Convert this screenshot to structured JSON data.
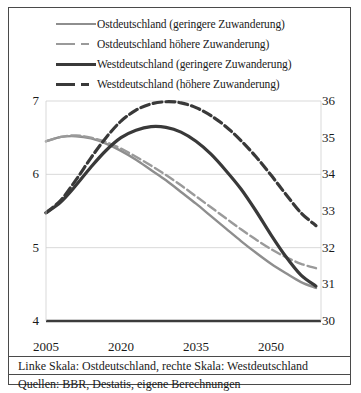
{
  "legend": {
    "entries": [
      {
        "label": "Ostdeutschland (geringere Zuwanderung)",
        "style": "gray-solid",
        "color": "#8e8e8e"
      },
      {
        "label": "Ostdeutschland höhere Zuwanderung)",
        "style": "gray-dashed",
        "color": "#9a9a9a"
      },
      {
        "label": "Westdeutschland (geringere Zuwanderung)",
        "style": "black-solid",
        "color": "#393939"
      },
      {
        "label": "Westdeutschland (höhere Zuwanderung)",
        "style": "black-dashed",
        "color": "#393939"
      }
    ]
  },
  "notes": {
    "scales": "Linke Skala: Ostdeutschland, rechte Skala: Westdeutschland",
    "sources": "Quellen: BBR, Destatis, eigene Berechnungen"
  },
  "chart_data": {
    "type": "line",
    "title": "",
    "xlabel": "",
    "ylabel": "",
    "y_left_label": "Ostdeutschland",
    "y_right_label": "Westdeutschland",
    "xlim": [
      2005,
      2060
    ],
    "xticks": [
      2005,
      2020,
      2035,
      2050
    ],
    "ylim_left": [
      4,
      7
    ],
    "yticks_left": [
      7,
      6,
      5,
      4
    ],
    "ylim_right": [
      30,
      36
    ],
    "yticks_right": [
      36,
      35,
      34,
      33,
      32,
      31,
      30
    ],
    "grid": true,
    "legend_position": "top",
    "series": [
      {
        "name": "Ostdeutschland (geringere Zuwanderung)",
        "axis": "left",
        "style": "solid",
        "color": "#8e8e8e",
        "width": 2.4,
        "x": [
          2005,
          2008,
          2011,
          2014,
          2017,
          2020,
          2023,
          2026,
          2029,
          2032,
          2035,
          2038,
          2041,
          2044,
          2047,
          2050,
          2053,
          2056,
          2059
        ],
        "values": [
          6.45,
          6.51,
          6.52,
          6.49,
          6.42,
          6.32,
          6.2,
          6.06,
          5.92,
          5.76,
          5.6,
          5.43,
          5.26,
          5.09,
          4.93,
          4.78,
          4.65,
          4.53,
          4.45
        ]
      },
      {
        "name": "Ostdeutschland höhere Zuwanderung)",
        "axis": "left",
        "style": "dashed",
        "color": "#9a9a9a",
        "width": 2.4,
        "x": [
          2005,
          2008,
          2011,
          2014,
          2017,
          2020,
          2023,
          2026,
          2029,
          2032,
          2035,
          2038,
          2041,
          2044,
          2047,
          2050,
          2053,
          2056,
          2059
        ],
        "values": [
          6.45,
          6.51,
          6.53,
          6.5,
          6.44,
          6.35,
          6.24,
          6.12,
          5.99,
          5.85,
          5.7,
          5.55,
          5.4,
          5.25,
          5.11,
          4.98,
          4.87,
          4.78,
          4.72
        ]
      },
      {
        "name": "Westdeutschland (geringere Zuwanderung)",
        "axis": "right",
        "style": "solid",
        "color": "#393939",
        "width": 3.2,
        "x": [
          2005,
          2008,
          2011,
          2014,
          2017,
          2020,
          2023,
          2026,
          2029,
          2032,
          2035,
          2038,
          2041,
          2044,
          2047,
          2050,
          2053,
          2056,
          2059
        ],
        "values": [
          32.95,
          33.25,
          33.7,
          34.2,
          34.65,
          35.0,
          35.2,
          35.3,
          35.28,
          35.15,
          34.9,
          34.55,
          34.1,
          33.6,
          33.0,
          32.35,
          31.75,
          31.25,
          30.95
        ]
      },
      {
        "name": "Westdeutschland (höhere Zuwanderung)",
        "axis": "right",
        "style": "dashed",
        "color": "#393939",
        "width": 3.2,
        "x": [
          2005,
          2008,
          2011,
          2014,
          2017,
          2020,
          2023,
          2026,
          2029,
          2032,
          2035,
          2038,
          2041,
          2044,
          2047,
          2050,
          2053,
          2056,
          2059
        ],
        "values": [
          32.95,
          33.3,
          33.85,
          34.45,
          35.0,
          35.45,
          35.75,
          35.92,
          35.98,
          35.95,
          35.82,
          35.6,
          35.3,
          34.92,
          34.48,
          33.98,
          33.45,
          32.95,
          32.6
        ]
      }
    ]
  }
}
